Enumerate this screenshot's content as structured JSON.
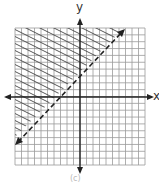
{
  "axes": {
    "x_label": "x",
    "y_label": "y"
  },
  "grid": {
    "cells": 20,
    "range": [
      -10,
      10
    ]
  },
  "boundary_line": {
    "style": "dashed",
    "slope": 1,
    "y_intercept": 3,
    "equation": "y = x + 3"
  },
  "shading": {
    "region": "above",
    "pattern": "diagonal-hatch",
    "inequality": "y > x + 3"
  },
  "caption": "(c)",
  "colors": {
    "grid": "#9a9a9a",
    "axis": "#222222",
    "line": "#222222",
    "hatch": "#444444"
  }
}
